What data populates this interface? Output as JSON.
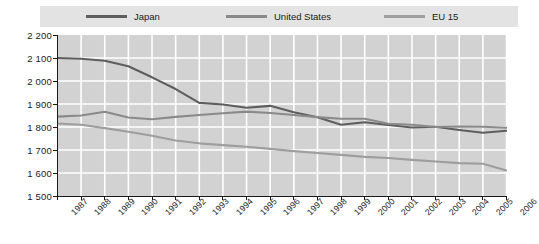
{
  "chart_data": {
    "type": "line",
    "title": "",
    "subtitle": "",
    "xlabel": "",
    "ylabel": "",
    "grid": true,
    "legend_position": "top",
    "ylim": [
      1500,
      2200
    ],
    "yticks": [
      "1 500",
      "1 600",
      "1 700",
      "1 800",
      "1 900",
      "2 000",
      "2 100",
      "2 200"
    ],
    "ytick_values": [
      1500,
      1600,
      1700,
      1800,
      1900,
      2000,
      2100,
      2200
    ],
    "categories": [
      "1987",
      "1988",
      "1989",
      "1990",
      "1991",
      "1992",
      "1993",
      "1994",
      "1995",
      "1996",
      "1997",
      "1998",
      "1999",
      "2000",
      "2001",
      "2002",
      "2003",
      "2004",
      "2005",
      "2006"
    ],
    "series": [
      {
        "name": "Japan",
        "color": "#5e5e5e",
        "values": [
          2100,
          2097,
          2088,
          2064,
          2016,
          1965,
          1905,
          1898,
          1884,
          1892,
          1864,
          1842,
          1810,
          1821,
          1809,
          1798,
          1801,
          1787,
          1775,
          1784
        ]
      },
      {
        "name": "United States",
        "color": "#8a8a8a",
        "values": [
          1845,
          1850,
          1866,
          1841,
          1834,
          1844,
          1852,
          1860,
          1867,
          1861,
          1852,
          1843,
          1836,
          1836,
          1814,
          1810,
          1800,
          1802,
          1801,
          1797
        ]
      },
      {
        "name": "EU 15",
        "color": "#9e9e9e",
        "values": [
          1815,
          1810,
          1795,
          1779,
          1762,
          1741,
          1729,
          1721,
          1714,
          1705,
          1695,
          1687,
          1679,
          1670,
          1665,
          1657,
          1650,
          1643,
          1640,
          1611
        ]
      }
    ]
  },
  "legend": {
    "items": [
      {
        "label": "Japan",
        "color": "#5e5e5e",
        "left": 86
      },
      {
        "label": "United States",
        "color": "#8a8a8a",
        "left": 226
      },
      {
        "label": "EU 15",
        "color": "#9e9e9e",
        "left": 384
      }
    ]
  },
  "colors": {
    "plot_background": "#d2d2d2",
    "gridline": "#ffffff",
    "axis": "#1a1a1a",
    "legend_band": "#e3e3e3",
    "page_background": "#ffffff"
  }
}
